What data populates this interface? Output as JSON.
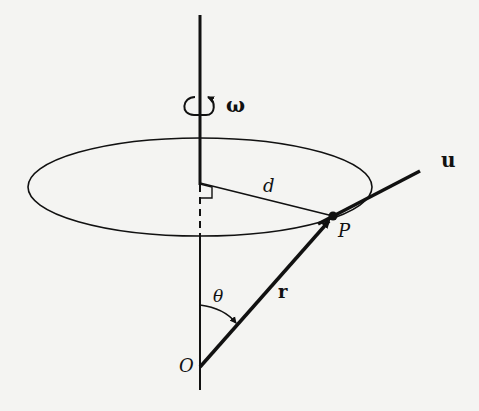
{
  "diagram": {
    "type": "rotating-body-kinematics",
    "labels": {
      "omega": "ω",
      "distance": "d",
      "point": "P",
      "origin": "O",
      "position_vector": "r",
      "angle": "θ",
      "tangent": "u"
    },
    "colors": {
      "background": "#f4f4f2",
      "ink": "#111111"
    },
    "geometry": {
      "axis": {
        "x": 200,
        "y_top": 15,
        "y_bottom": 390
      },
      "ellipse": {
        "cx": 200,
        "cy": 187,
        "rx": 172,
        "ry": 49
      },
      "origin_O": [
        200,
        367
      ],
      "point_P": [
        333,
        216
      ],
      "foot_of_perpendicular": [
        200,
        183
      ],
      "tangent_end": [
        420,
        171
      ]
    }
  }
}
